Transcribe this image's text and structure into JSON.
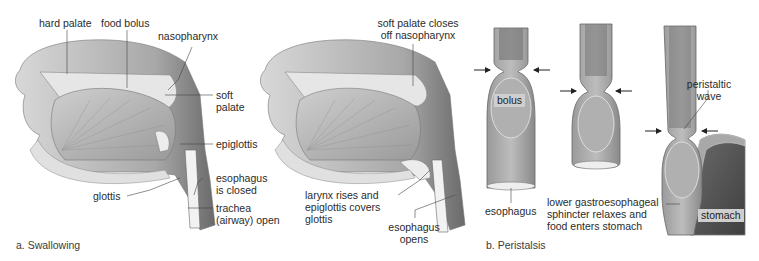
{
  "figure": {
    "panel_a": {
      "caption": "a. Swallowing",
      "left_illustration": {
        "labels": {
          "hard_palate": "hard palate",
          "food_bolus": "food bolus",
          "nasopharynx": "nasopharynx",
          "soft_palate_1": "soft",
          "soft_palate_2": "palate",
          "epiglottis": "epiglottis",
          "esophagus_closed_1": "esophagus",
          "esophagus_closed_2": "is closed",
          "trachea_1": "trachea",
          "trachea_2": "(airway) open",
          "glottis": "glottis"
        }
      },
      "right_illustration": {
        "labels": {
          "soft_palate_closes_1": "soft palate closes",
          "soft_palate_closes_2": "off nasopharynx",
          "larynx_rises_1": "larynx rises and",
          "larynx_rises_2": "epiglottis covers",
          "larynx_rises_3": "glottis",
          "esophagus_opens_1": "esophagus",
          "esophagus_opens_2": "opens"
        }
      }
    },
    "panel_b": {
      "caption": "b. Peristalsis",
      "labels": {
        "bolus": "bolus",
        "esophagus": "esophagus",
        "peristaltic_wave_1": "peristaltic",
        "peristaltic_wave_2": "wave",
        "lower_sphincter_1": "lower gastroesophageal",
        "lower_sphincter_2": "sphincter relaxes and",
        "lower_sphincter_3": "food enters stomach",
        "stomach": "stomach"
      }
    }
  },
  "colors": {
    "tissue_dark": "#5a5a5a",
    "tissue_mid": "#8c8c8c",
    "tissue_light": "#c8c8c8",
    "bone": "#e2e2e2",
    "label_text": "#2b2b2b",
    "tag_bg": "#cfcfcf"
  }
}
